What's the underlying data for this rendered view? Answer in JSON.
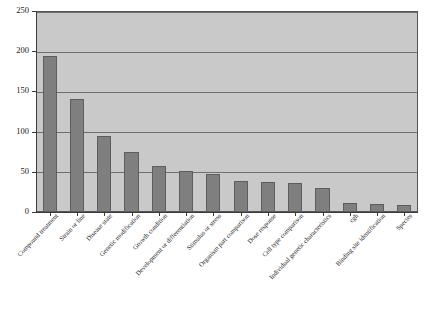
{
  "chart_data": {
    "type": "bar",
    "title": "",
    "subtitle": "",
    "xlabel": "",
    "ylabel": "",
    "ylim": [
      0,
      250
    ],
    "yticks": [
      0,
      50,
      100,
      150,
      200,
      250
    ],
    "grid": true,
    "legend": "none",
    "orientation": "vertical",
    "categories": [
      "Compound treatment",
      "Strain or line",
      "Disease state",
      "Genetic modification",
      "Growth condition",
      "Development or differentiation",
      "Stimulus or stress",
      "Organism part comparison",
      "Dose response",
      "Cell type comparison",
      "Individual genetic characteristics",
      "cgh",
      "Binding site identification",
      "Species"
    ],
    "values": [
      194,
      141,
      94,
      75,
      57,
      51,
      47,
      39,
      37,
      36,
      30,
      11,
      10,
      9
    ],
    "bar_color": "#7f7f7f",
    "bar_edge_color": "#5d5d5d",
    "plot_background": "#c9c9c9",
    "figure_background": "#ffffff",
    "gridline_color": "#6e6e6e",
    "axis_color": "#3a3a3a"
  }
}
